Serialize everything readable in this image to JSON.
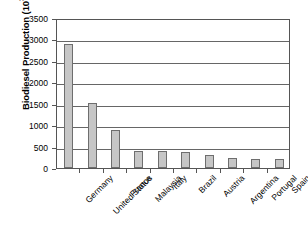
{
  "chart_data": {
    "type": "bar",
    "title": "",
    "subtitle": "",
    "xlabel": "",
    "ylabel": "Biodiesel Production (10³ ton)",
    "ylabel_prefix": "Biodiesel Production (10",
    "ylabel_exponent": "3",
    "ylabel_suffix": " ton)",
    "categories": [
      "Germany",
      "United Status",
      "France",
      "Malaysia",
      "Italy",
      "Brazil",
      "Austria",
      "Argentina",
      "Portugal",
      "Spain"
    ],
    "values": [
      2900,
      1520,
      880,
      400,
      390,
      380,
      300,
      230,
      210,
      200
    ],
    "ylim": [
      0,
      3500
    ],
    "ytick_values": [
      0,
      500,
      1000,
      1500,
      2000,
      2500,
      3000,
      3500
    ],
    "ytick_labels": [
      "0",
      "500",
      "1000",
      "1500",
      "2000",
      "2500",
      "3000",
      "3500"
    ],
    "grid": true,
    "legend": null,
    "legend_position": "none",
    "bar_fill_color": "#c6c6c6",
    "bar_border_color": "#6e6e6e",
    "grid_color": "#666666",
    "axis_color": "#555555",
    "text_color": "#000000",
    "background_color": "#ffffff"
  }
}
